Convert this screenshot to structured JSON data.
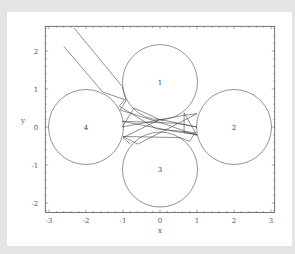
{
  "chart_data": {
    "type": "scatter",
    "title": "",
    "xlabel": "x",
    "ylabel": "y",
    "xlim": [
      -3.1,
      3.1
    ],
    "ylim": [
      -2.25,
      2.65
    ],
    "xticks": [
      -3,
      -2,
      -1,
      0,
      1,
      2,
      3
    ],
    "yticks": [
      -2,
      -1,
      0,
      1,
      2
    ],
    "grid": false,
    "legend": null,
    "circles": [
      {
        "label": "1",
        "cx": 0,
        "cy": 1.18,
        "r": 1.0
      },
      {
        "label": "2",
        "cx": 2,
        "cy": 0,
        "r": 1.0
      },
      {
        "label": "3",
        "cx": 0,
        "cy": -1.12,
        "r": 1.0
      },
      {
        "label": "4",
        "cx": -2,
        "cy": 0,
        "r": 1.0
      }
    ],
    "trajectories": [
      [
        [
          -2.32,
          2.6
        ],
        [
          -1.02,
          1.06
        ],
        [
          -0.92,
          0.69
        ],
        [
          -1.08,
          0.45
        ],
        [
          0.22,
          0.05
        ],
        [
          1.0,
          -0.22
        ],
        [
          0.65,
          0.37
        ],
        [
          0.65,
          -0.15
        ],
        [
          1.0,
          -0.2
        ],
        [
          0.3,
          -0.1
        ],
        [
          -1.02,
          0.15
        ],
        [
          0.4,
          0.1
        ],
        [
          1.0,
          0.0
        ],
        [
          0.0,
          0.2
        ],
        [
          -1.0,
          -0.28
        ],
        [
          -0.8,
          -0.45
        ]
      ],
      [
        [
          -2.6,
          2.12
        ],
        [
          -1.55,
          0.92
        ],
        [
          -0.95,
          0.72
        ],
        [
          -1.1,
          0.55
        ],
        [
          -0.1,
          -0.05
        ],
        [
          0.95,
          -0.15
        ],
        [
          0.8,
          -0.38
        ],
        [
          0.55,
          -0.28
        ],
        [
          -1.0,
          -0.25
        ],
        [
          -0.6,
          -0.45
        ],
        [
          0.2,
          -0.05
        ],
        [
          1.0,
          0.35
        ],
        [
          0.6,
          0.3
        ],
        [
          -1.02,
          0.0
        ],
        [
          -0.7,
          0.5
        ],
        [
          0.1,
          0.15
        ]
      ]
    ]
  }
}
